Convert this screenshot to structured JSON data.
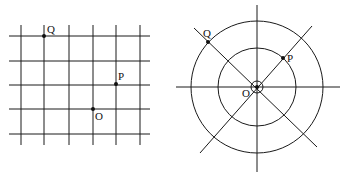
{
  "colors": {
    "line": "#1a1a1a",
    "point": "#111111",
    "background": "#ffffff"
  },
  "grid_diagram": {
    "vertical_x": [
      21,
      44,
      69,
      93,
      116,
      140
    ],
    "horizontal_y": [
      36,
      61,
      85,
      109,
      134
    ],
    "x_extent": [
      9,
      150
    ],
    "y_extent": [
      25,
      145
    ],
    "points": [
      {
        "label": "Q",
        "x": 44,
        "y": 36,
        "lx": 47,
        "ly": 33
      },
      {
        "label": "P",
        "x": 116,
        "y": 84,
        "lx": 118,
        "ly": 80
      },
      {
        "label": "O",
        "x": 93,
        "y": 109,
        "lx": 95,
        "ly": 120
      }
    ]
  },
  "polar_diagram": {
    "center": {
      "x": 257,
      "y": 87
    },
    "circle_radii": [
      6,
      39,
      66
    ],
    "lines": [
      {
        "x1": 176,
        "y1": 87,
        "x2": 340,
        "y2": 87
      },
      {
        "x1": 257,
        "y1": 5,
        "x2": 257,
        "y2": 172
      },
      {
        "x1": 194,
        "y1": 28,
        "x2": 317,
        "y2": 147
      },
      {
        "x1": 312,
        "y1": 26,
        "x2": 200,
        "y2": 153
      }
    ],
    "points": [
      {
        "label": "Q",
        "x": 208,
        "y": 42,
        "lx": 203,
        "ly": 37
      },
      {
        "label": "P",
        "x": 283,
        "y": 58,
        "lx": 287,
        "ly": 62
      },
      {
        "label": "O",
        "x": 257,
        "y": 87,
        "lx": 242,
        "ly": 97
      }
    ]
  }
}
